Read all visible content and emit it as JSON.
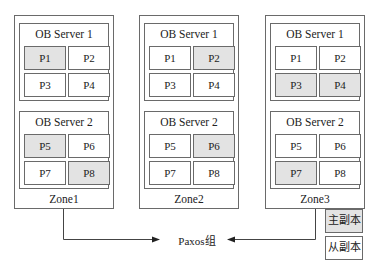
{
  "diagram": {
    "zones": [
      {
        "label": "Zone1",
        "servers": [
          {
            "title": "OB Server 1",
            "partitions": [
              {
                "label": "P1",
                "role": "leader"
              },
              {
                "label": "P2",
                "role": "follower"
              },
              {
                "label": "P3",
                "role": "follower"
              },
              {
                "label": "P4",
                "role": "follower"
              }
            ]
          },
          {
            "title": "OB Server 2",
            "partitions": [
              {
                "label": "P5",
                "role": "leader"
              },
              {
                "label": "P6",
                "role": "follower"
              },
              {
                "label": "P7",
                "role": "follower"
              },
              {
                "label": "P8",
                "role": "leader"
              }
            ]
          }
        ]
      },
      {
        "label": "Zone2",
        "servers": [
          {
            "title": "OB Server 1",
            "partitions": [
              {
                "label": "P1",
                "role": "follower"
              },
              {
                "label": "P2",
                "role": "leader"
              },
              {
                "label": "P3",
                "role": "follower"
              },
              {
                "label": "P4",
                "role": "follower"
              }
            ]
          },
          {
            "title": "OB Server 2",
            "partitions": [
              {
                "label": "P5",
                "role": "follower"
              },
              {
                "label": "P6",
                "role": "leader"
              },
              {
                "label": "P7",
                "role": "follower"
              },
              {
                "label": "P8",
                "role": "follower"
              }
            ]
          }
        ]
      },
      {
        "label": "Zone3",
        "servers": [
          {
            "title": "OB Server 1",
            "partitions": [
              {
                "label": "P1",
                "role": "follower"
              },
              {
                "label": "P2",
                "role": "follower"
              },
              {
                "label": "P3",
                "role": "leader"
              },
              {
                "label": "P4",
                "role": "leader"
              }
            ]
          },
          {
            "title": "OB Server 2",
            "partitions": [
              {
                "label": "P5",
                "role": "follower"
              },
              {
                "label": "P6",
                "role": "follower"
              },
              {
                "label": "P7",
                "role": "leader"
              },
              {
                "label": "P8",
                "role": "follower"
              }
            ]
          }
        ]
      }
    ],
    "paxos_label": "Paxos组",
    "legend": {
      "leader": "主副本",
      "follower": "从副本"
    },
    "colors": {
      "leader_fill": "#e3e3e3",
      "follower_fill": "#ffffff",
      "border": "#6a6a6a"
    }
  }
}
